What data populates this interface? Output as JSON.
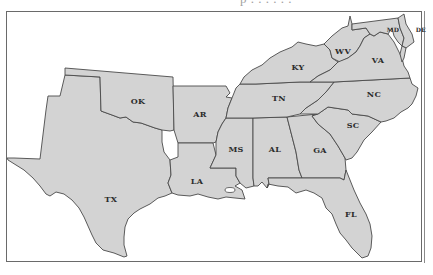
{
  "top_cut_text": "p                    .  .    .  . . .",
  "map": {
    "region": "Southern United States",
    "fill_color": "#d3d3d3",
    "stroke_color": "#4a4a4a",
    "background": "#ffffff",
    "states": [
      {
        "abbr": "TX"
      },
      {
        "abbr": "OK"
      },
      {
        "abbr": "AR"
      },
      {
        "abbr": "LA"
      },
      {
        "abbr": "MS"
      },
      {
        "abbr": "AL"
      },
      {
        "abbr": "GA"
      },
      {
        "abbr": "FL"
      },
      {
        "abbr": "SC"
      },
      {
        "abbr": "NC"
      },
      {
        "abbr": "TN"
      },
      {
        "abbr": "KY"
      },
      {
        "abbr": "WV"
      },
      {
        "abbr": "VA"
      },
      {
        "abbr": "MD"
      },
      {
        "abbr": "DE"
      }
    ]
  }
}
